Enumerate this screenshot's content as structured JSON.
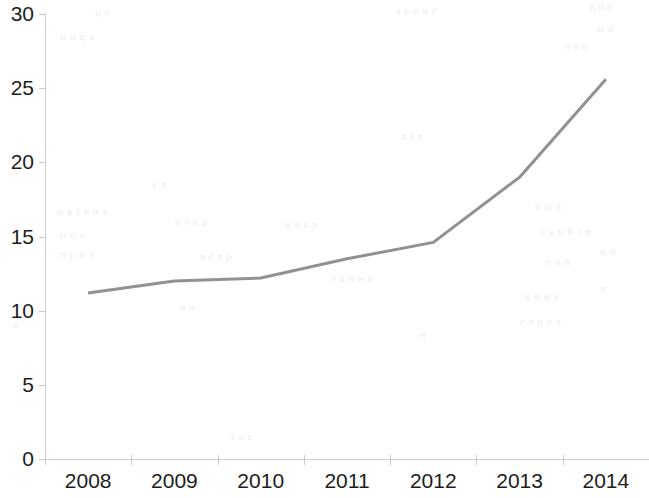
{
  "chart_data": {
    "type": "line",
    "title": "",
    "subtitle": "",
    "xlabel": "",
    "ylabel": "",
    "categories": [
      "2008",
      "2009",
      "2010",
      "2011",
      "2012",
      "2013",
      "2014"
    ],
    "series": [
      {
        "name": "series-1",
        "values": [
          11.2,
          12.0,
          12.2,
          13.5,
          14.6,
          19.0,
          25.6
        ],
        "color": "#919191"
      }
    ],
    "ylim": [
      0,
      30
    ],
    "yticks": [
      0,
      5,
      10,
      15,
      20,
      25,
      30
    ],
    "ytick_labels": [
      "0",
      "5",
      "10",
      "15",
      "20",
      "25",
      "30"
    ],
    "grid": false,
    "legend": "none",
    "markers": false,
    "line_width": 3
  },
  "axes": {
    "y_axis_color": "#d0d0d0",
    "x_axis_color": "#cdcdcd",
    "tick_color": "#c8c8c8",
    "label_color": "#1d1d1d"
  },
  "background": {
    "color": "#ffffff",
    "ghost_marks": [
      {
        "text": "и  т",
        "x": 95,
        "y": 6,
        "size": 11,
        "rot": -1
      },
      {
        "text": "л  е  н  и  е",
        "x": 395,
        "y": 4,
        "size": 11,
        "rot": -1
      },
      {
        "text": "8 0 0",
        "x": 590,
        "y": 2,
        "size": 10,
        "rot": 0
      },
      {
        "text": "н  и",
        "x": 598,
        "y": 22,
        "size": 11,
        "rot": 0
      },
      {
        "text": "э  т  о",
        "x": 565,
        "y": 40,
        "size": 11,
        "rot": 0
      },
      {
        "text": "н  и  ц  а",
        "x": 60,
        "y": 30,
        "size": 11,
        "rot": 0
      },
      {
        "text": "к  о",
        "x": 152,
        "y": 178,
        "size": 11,
        "rot": -1
      },
      {
        "text": "л  е  т",
        "x": 400,
        "y": 130,
        "size": 11,
        "rot": 0
      },
      {
        "text": "м  я  т  е    и    к",
        "x": 56,
        "y": 205,
        "size": 11,
        "rot": -1
      },
      {
        "text": "б  ы  л",
        "x": 535,
        "y": 200,
        "size": 11,
        "rot": 0
      },
      {
        "text": "п  о  л",
        "x": 60,
        "y": 228,
        "size": 11,
        "rot": 0
      },
      {
        "text": "с  к  и  й  с  я",
        "x": 540,
        "y": 225,
        "size": 11,
        "rot": 0
      },
      {
        "text": "о  т  к  р",
        "x": 175,
        "y": 215,
        "size": 11,
        "rot": 0
      },
      {
        "text": "н  а    с  у",
        "x": 285,
        "y": 218,
        "size": 11,
        "rot": 0
      },
      {
        "text": "н  и",
        "x": 600,
        "y": 245,
        "size": 11,
        "rot": 0
      },
      {
        "text": "п  р  и  х",
        "x": 60,
        "y": 248,
        "size": 11,
        "rot": 0
      },
      {
        "text": "в  с  т  р",
        "x": 200,
        "y": 250,
        "size": 11,
        "rot": 0
      },
      {
        "text": "п  о  п",
        "x": 545,
        "y": 255,
        "size": 11,
        "rot": 0
      },
      {
        "text": "л  а  н  и  я",
        "x": 330,
        "y": 272,
        "size": 11,
        "rot": 0
      },
      {
        "text": "я",
        "x": 600,
        "y": 282,
        "size": 11,
        "rot": 0
      },
      {
        "text": "к  о  м  у",
        "x": 525,
        "y": 290,
        "size": 11,
        "rot": 0
      },
      {
        "text": "в  о",
        "x": 180,
        "y": 300,
        "size": 11,
        "rot": 0
      },
      {
        "text": "с  т  р  о  я",
        "x": 520,
        "y": 315,
        "size": 11,
        "rot": 0
      },
      {
        "text": "н",
        "x": 420,
        "y": 328,
        "size": 11,
        "rot": 0
      },
      {
        "text": "т  о  г",
        "x": 230,
        "y": 430,
        "size": 11,
        "rot": 0
      },
      {
        "text": "е",
        "x": 14,
        "y": 318,
        "size": 11,
        "rot": 0
      }
    ]
  }
}
